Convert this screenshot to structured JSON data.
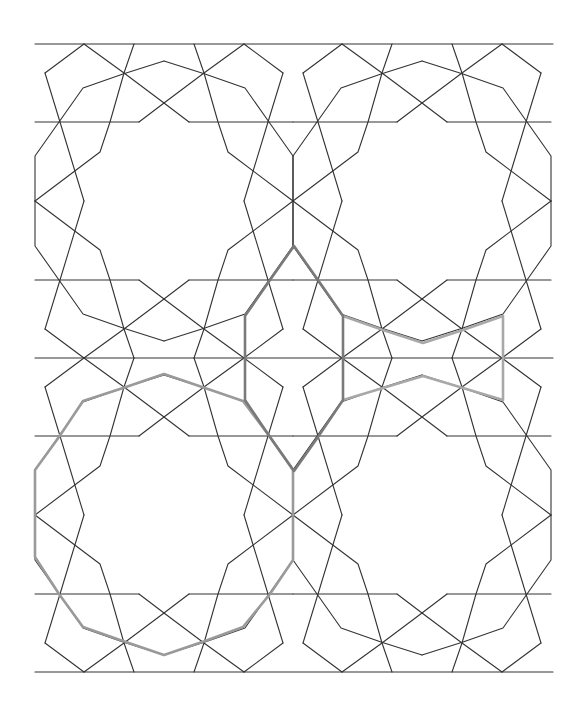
{
  "diagram": {
    "title": "",
    "rosette_count": 4,
    "rosette_layout": "2 columns x 2 rows",
    "colors": {
      "background": "#ffffff",
      "line": "#333333",
      "highlight_decagon": "#9a9a9a",
      "highlight_elongated_hexagon": "#7a7a7a",
      "highlight_bowtie": "#a8a8a8"
    },
    "highlighted_shapes": [
      {
        "name": "decagon-outline",
        "location": "bottom-left rosette"
      },
      {
        "name": "elongated-hexagon",
        "location": "center column"
      },
      {
        "name": "bowtie",
        "location": "center-right between rosettes"
      }
    ]
  }
}
